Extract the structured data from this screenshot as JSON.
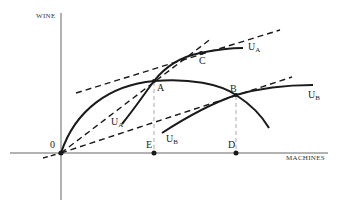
{
  "diagram": {
    "axes": {
      "y_label": "WINE",
      "x_label": "MACHINES",
      "origin_label": "0"
    },
    "points": {
      "A": "A",
      "B": "B",
      "C": "C",
      "D": "D",
      "E": "E"
    },
    "curves": {
      "ua_upper": {
        "base": "U",
        "sub": "A"
      },
      "ua_lower": {
        "base": "U",
        "sub": "A"
      },
      "ub_upper": {
        "base": "U",
        "sub": "B"
      },
      "ub_lower": {
        "base": "U",
        "sub": "B"
      }
    },
    "colors": {
      "ink": "#1a1a1a",
      "axis": "#555555",
      "guide": "#aaaaaa"
    }
  }
}
